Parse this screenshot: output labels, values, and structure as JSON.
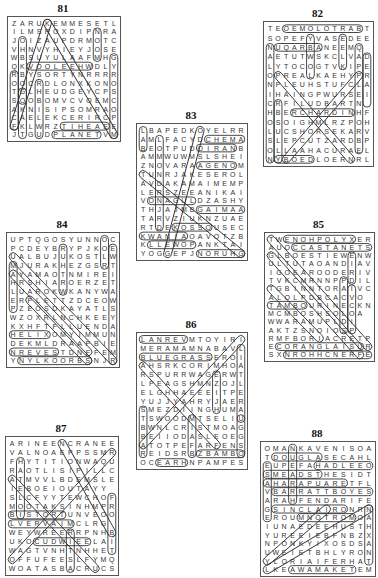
{
  "puzzles": [
    {
      "number": "81",
      "box": {
        "x": 7,
        "y": 16,
        "w": 112,
        "h": 124
      },
      "rows": [
        "ZARUKEMMESETL",
        "ILMSROXDIPNRA",
        "JOIZAUPDRMOTC",
        "VHNVYHIEYJOSE",
        "WBSUYULAAFMHG",
        "QKVOOLEEHWDLY",
        "RBYSORTYNRRRR",
        "OOCRDLONXKONO",
        "TGLHEUDGEYCPS",
        "SOOBOMVCVOEMC",
        "AKNISIPSOMRAO",
        "CAELEKCERIRCP",
        "FKLWRZTIHEAEE",
        "JTGUDPLANETVM"
      ],
      "highlights": [
        {
          "r1": 13,
          "c1": 5,
          "r2": 13,
          "c2": 10
        },
        {
          "r1": 12,
          "c1": 6,
          "r2": 12,
          "c2": 11
        },
        {
          "r1": 5,
          "c1": 2,
          "r2": 5,
          "c2": 9
        },
        {
          "r1": 1,
          "c1": 10,
          "r2": 4,
          "c2": 10
        },
        {
          "r1": 4,
          "c1": 12,
          "r2": 13,
          "c2": 12
        },
        {
          "r1": 0,
          "c1": 4,
          "r2": 12,
          "c2": 0
        },
        {
          "r1": 0,
          "c1": 4,
          "r2": 13,
          "c2": 12
        },
        {
          "r1": 6,
          "c1": 0,
          "r2": 12,
          "c2": 0
        },
        {
          "r1": 8,
          "c1": 1,
          "r2": 13,
          "c2": 1
        },
        {
          "r1": 7,
          "c1": 3,
          "r2": 13,
          "c2": 3
        },
        {
          "r1": 2,
          "c1": 1,
          "r2": 9,
          "c2": 1
        }
      ]
    },
    {
      "number": "82",
      "box": {
        "x": 263,
        "y": 21,
        "w": 109,
        "h": 144
      },
      "rows": [
        "TEOEMOLOTRABT",
        "SOPEFYVASEDEE",
        "NUQARBANEEMQ",
        "AETUTWSKCLVAD",
        "LYTOCOGTVKIPE",
        "OPREALKAEHYPR",
        "NPLEUHSTUFCLA",
        "IHAINGPWURSEI",
        "CRFILUDBARTN",
        "HBERCHARDINHF",
        "OSOIGHMLRZPOH",
        "LUCSHORSEKARV",
        "SLEPCUTZARDBPU",
        "OLLAAHACURAEL",
        "NYBOEDLOERNRL"
      ],
      "highlights": [
        {
          "r1": 0,
          "c1": 2,
          "r2": 0,
          "c2": 11
        },
        {
          "r1": 2,
          "c1": 1,
          "r2": 2,
          "c2": 6
        },
        {
          "r1": 9,
          "c1": 3,
          "r2": 9,
          "c2": 10
        },
        {
          "r1": 1,
          "c1": 5,
          "r2": 5,
          "c2": 5
        },
        {
          "r1": 1,
          "c1": 9,
          "r2": 4,
          "c2": 9
        },
        {
          "r1": 2,
          "c1": 11,
          "r2": 13,
          "c2": 11
        },
        {
          "r1": 3,
          "c1": 12,
          "r2": 8,
          "c2": 12
        },
        {
          "r1": 2,
          "c1": 0,
          "r2": 14,
          "c2": 0
        },
        {
          "r1": 8,
          "c1": 1,
          "r2": 14,
          "c2": 1
        },
        {
          "r1": 14,
          "c1": 1,
          "r2": 14,
          "c2": 5
        },
        {
          "r1": 5,
          "c1": 1,
          "r2": 14,
          "c2": 10
        },
        {
          "r1": 14,
          "c1": 2,
          "r2": 5,
          "c2": 11
        }
      ]
    },
    {
      "number": "83",
      "box": {
        "x": 136,
        "y": 123,
        "w": 110,
        "h": 136
      },
      "rows": [
        "LBAPEDKOYELRR",
        "AMLFACYDCHEMA",
        "BEOTPUDOIRANB",
        "AMMWUWMSLSHEI",
        "ZNOVARAAGENOM",
        "TUNRJAKESEROL",
        "AVDAKAMAIMEMP",
        "LERSZEEANIKAI",
        "VONAGULDZASHY",
        "THJAJMBGAIMAA",
        "TARVZIUKNZUAE",
        "RTDEKOSSOUSEC",
        "KWANIAOAVOTZB",
        "KLLEWOPANKTAI",
        "YOGGEPJNORUHG"
      ],
      "highlights": [
        {
          "r1": 1,
          "c1": 8,
          "r2": 1,
          "c2": 12
        },
        {
          "r1": 2,
          "c1": 7,
          "r2": 2,
          "c2": 11
        },
        {
          "r1": 4,
          "c1": 7,
          "r2": 4,
          "c2": 11
        },
        {
          "r1": 8,
          "c1": 1,
          "r2": 8,
          "c2": 6
        },
        {
          "r1": 9,
          "c1": 7,
          "r2": 9,
          "c2": 12
        },
        {
          "r1": 11,
          "c1": 4,
          "r2": 11,
          "c2": 8
        },
        {
          "r1": 12,
          "c1": 0,
          "r2": 12,
          "c2": 5
        },
        {
          "r1": 13,
          "c1": 1,
          "r2": 13,
          "c2": 6
        },
        {
          "r1": 14,
          "c1": 7,
          "r2": 14,
          "c2": 12
        },
        {
          "r1": 0,
          "c1": 0,
          "r2": 2,
          "c2": 0
        },
        {
          "r1": 1,
          "c1": 2,
          "r2": 11,
          "c2": 2
        },
        {
          "r1": 5,
          "c1": 0,
          "r2": 14,
          "c2": 12
        },
        {
          "r1": 0,
          "c1": 7,
          "r2": 14,
          "c2": 3
        }
      ]
    },
    {
      "number": "84",
      "box": {
        "x": 6,
        "y": 232,
        "w": 112,
        "h": 134
      },
      "rows": [
        "UPTQGOSYUNNOC",
        "PCDEYBRYPJKOE",
        "UALBUJUKOSTLW",
        "MJURAKHEZGSRT",
        "AYAMAOTNMIREI",
        "HRSHIAROERZETA",
        "LUAROKWKANYWAR",
        "ERPLETTZDCEOWT",
        "PZEOSDKAYATLS",
        "WZOXRLNCHKEEYI",
        "KXHFTFLLUENDA",
        "HELIXOMYIMMUN",
        "DEKMLDRAAPBIE",
        "NREVESTDNFFEM",
        "YNYLKOORBSNJR"
      ],
      "highlights": [
        {
          "r1": 11,
          "c1": 0,
          "r2": 11,
          "c2": 4
        },
        {
          "r1": 13,
          "c1": 0,
          "r2": 13,
          "c2": 5
        },
        {
          "r1": 14,
          "c1": 1,
          "r2": 14,
          "c2": 9
        },
        {
          "r1": 0,
          "c1": 11,
          "r2": 3,
          "c2": 11
        },
        {
          "r1": 1,
          "c1": 12,
          "r2": 14,
          "c2": 12
        },
        {
          "r1": 1,
          "c1": 6,
          "r2": 6,
          "c2": 6
        },
        {
          "r1": 3,
          "c1": 0,
          "r2": 8,
          "c2": 0
        },
        {
          "r1": 2,
          "c1": 0,
          "r2": 14,
          "c2": 12
        },
        {
          "r1": 4,
          "c1": 0,
          "r2": 13,
          "c2": 9
        },
        {
          "r1": 7,
          "c1": 2,
          "r2": 14,
          "c2": 9
        }
      ]
    },
    {
      "number": "85",
      "box": {
        "x": 264,
        "y": 232,
        "w": 109,
        "h": 128
      },
      "rows": [
        "TWENOHPOLYXER",
        "AUOCCASTANETS",
        "GLBOESTIEWENW",
        "ULTUTAOANDIAV",
        "IGOEAROODERIVI",
        "TVKCMRNNPPDIL",
        "TGBINNTORAIVC",
        "ALOLPDBCACVO",
        "TAMBOURINECKN",
        "MCMBOSHSOLOA",
        "WWARAMUPLDI",
        "AKTZSNOIOSP",
        "RMFBORIACRETP",
        "ECORANGLAISUR",
        "SXNROHHCNERFE"
      ],
      "highlights": [
        {
          "r1": 0,
          "c1": 2,
          "r2": 0,
          "c2": 10
        },
        {
          "r1": 1,
          "c1": 3,
          "r2": 1,
          "c2": 12
        },
        {
          "r1": 8,
          "c1": 0,
          "r2": 8,
          "c2": 4
        },
        {
          "r1": 13,
          "c1": 1,
          "r2": 13,
          "c2": 11
        },
        {
          "r1": 14,
          "c1": 2,
          "r2": 14,
          "c2": 12
        },
        {
          "r1": 2,
          "c1": 10,
          "r2": 5,
          "c2": 10
        },
        {
          "r1": 5,
          "c1": 9,
          "r2": 11,
          "c2": 9
        },
        {
          "r1": 6,
          "c1": 10,
          "r2": 11,
          "c2": 10
        },
        {
          "r1": 0,
          "c1": 0,
          "r2": 13,
          "c2": 12
        },
        {
          "r1": 2,
          "c1": 0,
          "r2": 14,
          "c2": 11
        },
        {
          "r1": 6,
          "c1": 0,
          "r2": 12,
          "c2": 6
        }
      ]
    },
    {
      "number": "86",
      "box": {
        "x": 136,
        "y": 332,
        "w": 110,
        "h": 136
      },
      "rows": [
        "LANREVMTOYIRI",
        "MERAMAMNABAVL",
        "BLUEGRASSEROI",
        "AHSRKCORIMHOA",
        "RSPURRWAGERWT",
        "LPEAGSHMNZOJL",
        "ELGHHAEEEITPE",
        "YUJJYAHRYJAER",
        "SMEZDIINGHUMAR",
        "TSWOODMTSELIU",
        "BWNLCRISTMOAG",
        "BEIIODASLEOEG",
        "ATOTPEFARFENS",
        "REIDSRBZBAMBOO",
        "OCEARHNPAMPES"
      ],
      "highlights": [
        {
          "r1": 0,
          "c1": 0,
          "r2": 0,
          "c2": 5
        },
        {
          "r1": 2,
          "c1": 0,
          "r2": 2,
          "c2": 8
        },
        {
          "r1": 13,
          "c1": 7,
          "r2": 13,
          "c2": 12
        },
        {
          "r1": 1,
          "c1": 12,
          "r2": 9,
          "c2": 12
        },
        {
          "r1": 9,
          "c1": 12,
          "r2": 13,
          "c2": 12
        },
        {
          "r1": 4,
          "c1": 9,
          "r2": 8,
          "c2": 9
        },
        {
          "r1": 9,
          "c1": 6,
          "r2": 13,
          "c2": 6
        },
        {
          "r1": 8,
          "c1": 0,
          "r2": 13,
          "c2": 0
        },
        {
          "r1": 3,
          "c1": 0,
          "r2": 12,
          "c2": 9
        },
        {
          "r1": 12,
          "c1": 0,
          "r2": 0,
          "c2": 12
        },
        {
          "r1": 14,
          "c1": 2,
          "r2": 14,
          "c2": 5
        }
      ]
    },
    {
      "number": "87",
      "box": {
        "x": 5,
        "y": 436,
        "w": 112,
        "h": 138
      },
      "rows": [
        "ARINEENCRANEE",
        "VALNOAEPPSSMR",
        "FHYTITIONWAQU",
        "RAOTLISIPILLC",
        "ATMVVLBDEMSLE",
        "IEBOEIOUTAYY",
        "SLCFYYTEWCHOF",
        "MOOTAKSINHMPR",
        "BISTORTUNVEOO",
        "LVERVAIMCLRG",
        "WEYWREERRPNHB",
        "UKOCUDWIEELAI",
        "WAGTVNHTNHHET",
        "OFFUFEESLFYMQ",
        "WOATASBACRUCS"
      ],
      "highlights": [
        {
          "r1": 8,
          "c1": 0,
          "r2": 8,
          "c2": 6
        },
        {
          "r1": 9,
          "c1": 0,
          "r2": 9,
          "c2": 7
        },
        {
          "r1": 11,
          "c1": 3,
          "r2": 11,
          "c2": 9
        },
        {
          "r1": 10,
          "c1": 7,
          "r2": 14,
          "c2": 7
        },
        {
          "r1": 6,
          "c1": 12,
          "r2": 12,
          "c2": 12
        },
        {
          "r1": 2,
          "c1": 1,
          "r2": 8,
          "c2": 1
        },
        {
          "r1": 0,
          "c1": 6,
          "r2": 10,
          "c2": 12
        },
        {
          "r1": 13,
          "c1": 0,
          "r2": 1,
          "c2": 12
        },
        {
          "r1": 4,
          "c1": 0,
          "r2": 14,
          "c2": 10
        }
      ]
    },
    {
      "number": "88",
      "box": {
        "x": 260,
        "y": 441,
        "w": 114,
        "h": 134
      },
      "rows": [
        "OMANKAVENISOA",
        "TDOUGLASECAHL",
        "EUPEFAHADLEEO",
        "SMEADSTHESIDT",
        "AHARAPUARETFL",
        "VBARRATTBOYES",
        "ARAHFENDARIFE",
        "GSINCLAIRONRN",
        "EROUMNOTROMOA",
        "IUNAEDEEHUSTH",
        "YUREEIEBFNBZXT",
        "NPONKYIXOSDSA",
        "UWEIETBHLYRON",
        "YLORIAIFERHAT",
        "LKEAWAMAKETEM"
      ],
      "highlights": [
        {
          "r1": 1,
          "c1": 1,
          "r2": 1,
          "c2": 6
        },
        {
          "r1": 2,
          "c1": 6,
          "r2": 2,
          "c2": 12
        },
        {
          "r1": 3,
          "c1": 0,
          "r2": 3,
          "c2": 6
        },
        {
          "r1": 4,
          "c1": 0,
          "r2": 4,
          "c2": 9
        },
        {
          "r1": 5,
          "c1": 1,
          "r2": 5,
          "c2": 12
        },
        {
          "r1": 7,
          "c1": 1,
          "r2": 7,
          "c2": 9
        },
        {
          "r1": 8,
          "c1": 4,
          "r2": 8,
          "c2": 10
        },
        {
          "r1": 14,
          "c1": 3,
          "r2": 14,
          "c2": 10
        },
        {
          "r1": 7,
          "c1": 12,
          "r2": 13,
          "c2": 12
        },
        {
          "r1": 2,
          "c1": 0,
          "r2": 8,
          "c2": 0
        },
        {
          "r1": 0,
          "c1": 3,
          "r2": 6,
          "c2": 3
        },
        {
          "r1": 14,
          "c1": 0,
          "r2": 7,
          "c2": 12
        },
        {
          "r1": 13,
          "c1": 0,
          "r2": 7,
          "c2": 7
        }
      ]
    }
  ]
}
